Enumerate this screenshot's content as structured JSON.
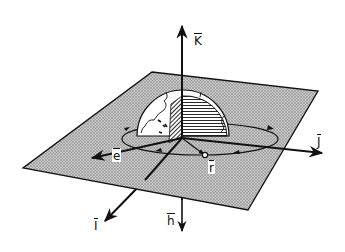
{
  "diagram": {
    "title": "",
    "colors": {
      "ink": "#111111",
      "plane_fill": "#b8b8b8",
      "background": "#ffffff"
    },
    "labels": {
      "K": "K",
      "J": "J",
      "I": "I",
      "h": "h",
      "e": "e",
      "r": "r"
    },
    "elements": [
      {
        "id": "K-axis",
        "kind": "vector",
        "label": "K"
      },
      {
        "id": "J-axis",
        "kind": "vector",
        "label": "J"
      },
      {
        "id": "I-axis",
        "kind": "vector",
        "label": "I"
      },
      {
        "id": "h-vector",
        "kind": "vector",
        "label": "h"
      },
      {
        "id": "e-vector",
        "kind": "vector",
        "label": "e"
      },
      {
        "id": "r-vector",
        "kind": "vector",
        "label": "r"
      },
      {
        "id": "orbital-plane",
        "kind": "shaded-plane"
      },
      {
        "id": "earth",
        "kind": "hemisphere"
      },
      {
        "id": "orbit",
        "kind": "ellipse"
      }
    ]
  }
}
